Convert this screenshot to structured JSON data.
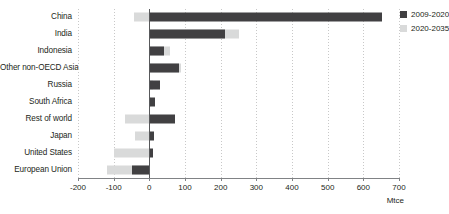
{
  "chart_data": {
    "type": "bar",
    "orientation": "horizontal",
    "title": "",
    "xlabel": "Mtce",
    "ylabel": "",
    "xlim": [
      -200,
      700
    ],
    "xticks": [
      -200,
      -100,
      0,
      100,
      200,
      300,
      400,
      500,
      600,
      700
    ],
    "xtick_labels": [
      "-200",
      "-100",
      "0",
      "100",
      "200",
      "300",
      "400",
      "500",
      "600",
      "700"
    ],
    "grid": true,
    "legend_position": "right",
    "categories": [
      "China",
      "India",
      "Indonesia",
      "Other non-OECD Asia",
      "Russia",
      "South Africa",
      "Rest of world",
      "Japan",
      "United States",
      "European Union"
    ],
    "series": [
      {
        "name": "2009-2020",
        "color": "#414042",
        "values": [
          653,
          213,
          40,
          82,
          31,
          17,
          73,
          12,
          11,
          -48
        ]
      },
      {
        "name": "2020-2035",
        "color": "#d9dada",
        "values": [
          -42,
          252,
          58,
          90,
          10,
          5,
          -67,
          -40,
          -98,
          -120
        ]
      }
    ]
  },
  "legend": {
    "items": [
      {
        "label": "2009-2020",
        "color": "#414042"
      },
      {
        "label": "2020-2035",
        "color": "#d9dada"
      }
    ]
  },
  "axis": {
    "unit_label": "Mtce"
  }
}
